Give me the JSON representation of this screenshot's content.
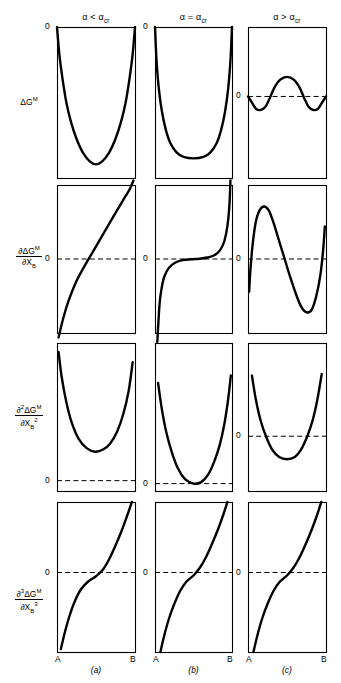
{
  "figure": {
    "background": "#ffffff",
    "ink": "#000000"
  },
  "columns": [
    {
      "id": "a",
      "header": "α < α",
      "header_sub": "cr",
      "letter": "(a)",
      "x": 57,
      "width": 78
    },
    {
      "id": "b",
      "header": "α = α",
      "header_sub": "cr",
      "letter": "(b)",
      "x": 155,
      "width": 77
    },
    {
      "id": "c",
      "header": "α > α",
      "header_sub": "cr",
      "letter": "(c)",
      "x": 248,
      "width": 78
    }
  ],
  "rows": [
    {
      "id": "g",
      "numerator": "∂",
      "label_plain": "ΔG",
      "label_sup": "M",
      "kind": "plain",
      "y": 27,
      "height": 151
    },
    {
      "id": "d1",
      "num_pre": "∂",
      "num_mid": "ΔG",
      "num_sup": "M",
      "den_pre": "∂",
      "den_var": "X",
      "den_sub": "B",
      "den_sup": "",
      "kind": "fraction",
      "y": 185,
      "height": 148
    },
    {
      "id": "d2",
      "num_pre": "∂",
      "num_order": "2",
      "num_mid": "ΔG",
      "num_sup": "M",
      "den_pre": "∂",
      "den_var": "X",
      "den_sub": "B",
      "den_sup": "2",
      "kind": "fraction",
      "y": 343,
      "height": 148
    },
    {
      "id": "d3",
      "num_pre": "∂",
      "num_order": "3",
      "num_mid": "ΔG",
      "num_sup": "M",
      "den_pre": "∂",
      "den_var": "X",
      "den_sub": "B",
      "den_sup": "3",
      "kind": "fraction",
      "y": 502,
      "height": 150
    }
  ],
  "axis": {
    "left_endpoint": "A",
    "right_endpoint": "B",
    "zero_label": "0"
  },
  "chart_data": {
    "type": "line",
    "xlabel": "X_B (from A to B)",
    "ylabel_rows": [
      "ΔG^M",
      "∂ΔG^M/∂X_B",
      "∂²ΔG^M/∂X_B²",
      "∂³ΔG^M/∂X_B³"
    ],
    "column_conditions": [
      "α < α_cr",
      "α = α_cr",
      "α > α_cr"
    ],
    "grid": false,
    "legend": "none",
    "xlim": [
      0,
      1
    ],
    "panels": [
      {
        "row": "g",
        "col": "a",
        "zero_label_pos": "top-left-outside",
        "zero_y_frac": 0.0,
        "dashed_zero": false,
        "description": "Deep symmetric U; starts and ends at 0 on the top edge, minimum near mid-bottom.",
        "points": [
          [
            0.0,
            0.0
          ],
          [
            0.03,
            0.18
          ],
          [
            0.07,
            0.34
          ],
          [
            0.12,
            0.5
          ],
          [
            0.18,
            0.63
          ],
          [
            0.25,
            0.74
          ],
          [
            0.33,
            0.83
          ],
          [
            0.42,
            0.89
          ],
          [
            0.5,
            0.91
          ],
          [
            0.58,
            0.89
          ],
          [
            0.67,
            0.83
          ],
          [
            0.75,
            0.74
          ],
          [
            0.82,
            0.63
          ],
          [
            0.88,
            0.5
          ],
          [
            0.93,
            0.34
          ],
          [
            0.97,
            0.18
          ],
          [
            1.0,
            0.0
          ]
        ]
      },
      {
        "row": "g",
        "col": "b",
        "zero_label_pos": "top-left-outside",
        "zero_y_frac": 0.0,
        "dashed_zero": false,
        "description": "Broad flat-bottomed U; zero at both ends, wide flat minimum.",
        "points": [
          [
            0.0,
            0.0
          ],
          [
            0.02,
            0.22
          ],
          [
            0.05,
            0.41
          ],
          [
            0.09,
            0.56
          ],
          [
            0.14,
            0.68
          ],
          [
            0.2,
            0.77
          ],
          [
            0.28,
            0.83
          ],
          [
            0.37,
            0.86
          ],
          [
            0.5,
            0.87
          ],
          [
            0.63,
            0.86
          ],
          [
            0.72,
            0.83
          ],
          [
            0.8,
            0.77
          ],
          [
            0.86,
            0.68
          ],
          [
            0.91,
            0.56
          ],
          [
            0.95,
            0.41
          ],
          [
            0.98,
            0.22
          ],
          [
            1.0,
            0.0
          ]
        ]
      },
      {
        "row": "g",
        "col": "c",
        "zero_label_pos": "left-outside",
        "zero_y_frac": 0.46,
        "dashed_zero": true,
        "description": "W-shape: two shallow minima below zero separated by a central hump rising above zero.",
        "points": [
          [
            0.0,
            0.46
          ],
          [
            0.05,
            0.5
          ],
          [
            0.1,
            0.54
          ],
          [
            0.16,
            0.55
          ],
          [
            0.22,
            0.53
          ],
          [
            0.28,
            0.47
          ],
          [
            0.34,
            0.4
          ],
          [
            0.41,
            0.35
          ],
          [
            0.5,
            0.33
          ],
          [
            0.59,
            0.35
          ],
          [
            0.66,
            0.4
          ],
          [
            0.72,
            0.47
          ],
          [
            0.78,
            0.53
          ],
          [
            0.84,
            0.55
          ],
          [
            0.9,
            0.54
          ],
          [
            0.95,
            0.5
          ],
          [
            1.0,
            0.46
          ]
        ]
      },
      {
        "row": "d1",
        "col": "a",
        "zero_label_pos": "left-outside",
        "zero_y_frac": 0.5,
        "dashed_zero": true,
        "description": "Monotonic increasing curve, crosses zero slightly right of centre, steep at both ends.",
        "points": [
          [
            0.02,
            1.03
          ],
          [
            0.08,
            0.9
          ],
          [
            0.15,
            0.78
          ],
          [
            0.24,
            0.66
          ],
          [
            0.34,
            0.56
          ],
          [
            0.45,
            0.46
          ],
          [
            0.56,
            0.36
          ],
          [
            0.66,
            0.27
          ],
          [
            0.76,
            0.18
          ],
          [
            0.85,
            0.1
          ],
          [
            0.93,
            0.03
          ],
          [
            0.98,
            -0.03
          ]
        ]
      },
      {
        "row": "d1",
        "col": "b",
        "zero_label_pos": "left-outside",
        "zero_y_frac": 0.5,
        "dashed_zero": true,
        "description": "Monotonic increasing with a flat horizontal inflection plateau exactly on the zero line at mid-composition; asymptotically steep at both ends.",
        "points": [
          [
            0.03,
            1.06
          ],
          [
            0.045,
            0.92
          ],
          [
            0.06,
            0.8
          ],
          [
            0.085,
            0.7
          ],
          [
            0.12,
            0.62
          ],
          [
            0.18,
            0.56
          ],
          [
            0.26,
            0.525
          ],
          [
            0.36,
            0.508
          ],
          [
            0.47,
            0.502
          ],
          [
            0.58,
            0.498
          ],
          [
            0.68,
            0.49
          ],
          [
            0.77,
            0.475
          ],
          [
            0.845,
            0.44
          ],
          [
            0.9,
            0.38
          ],
          [
            0.94,
            0.28
          ],
          [
            0.965,
            0.15
          ],
          [
            0.98,
            -0.03
          ]
        ]
      },
      {
        "row": "d1",
        "col": "c",
        "zero_label_pos": "left-outside",
        "zero_y_frac": 0.5,
        "dashed_zero": true,
        "description": "Non-monotonic S: rises steeply from below zero to a local maximum, falls through zero to a local minimum, then rises steeply again at the right edge.",
        "points": [
          [
            0.015,
            0.72
          ],
          [
            0.03,
            0.58
          ],
          [
            0.06,
            0.4
          ],
          [
            0.1,
            0.25
          ],
          [
            0.15,
            0.17
          ],
          [
            0.21,
            0.145
          ],
          [
            0.27,
            0.175
          ],
          [
            0.33,
            0.26
          ],
          [
            0.4,
            0.38
          ],
          [
            0.47,
            0.5
          ],
          [
            0.54,
            0.62
          ],
          [
            0.61,
            0.73
          ],
          [
            0.68,
            0.82
          ],
          [
            0.75,
            0.86
          ],
          [
            0.82,
            0.84
          ],
          [
            0.88,
            0.74
          ],
          [
            0.93,
            0.6
          ],
          [
            0.965,
            0.43
          ],
          [
            0.985,
            0.28
          ]
        ]
      },
      {
        "row": "d2",
        "col": "a",
        "zero_label_pos": "left-outside",
        "zero_y_frac": 0.93,
        "dashed_zero": true,
        "description": "U-shaped curve lying entirely above the zero line; minimum well above zero.",
        "points": [
          [
            0.02,
            0.06
          ],
          [
            0.06,
            0.23
          ],
          [
            0.12,
            0.4
          ],
          [
            0.19,
            0.54
          ],
          [
            0.28,
            0.65
          ],
          [
            0.38,
            0.71
          ],
          [
            0.49,
            0.735
          ],
          [
            0.59,
            0.72
          ],
          [
            0.68,
            0.68
          ],
          [
            0.77,
            0.6
          ],
          [
            0.85,
            0.48
          ],
          [
            0.92,
            0.32
          ],
          [
            0.97,
            0.13
          ]
        ]
      },
      {
        "row": "d2",
        "col": "b",
        "zero_label_pos": "left-outside",
        "zero_y_frac": 0.95,
        "dashed_zero": true,
        "description": "U-shaped curve whose minimum is exactly tangent to the zero line at mid-composition.",
        "points": [
          [
            0.04,
            0.27
          ],
          [
            0.09,
            0.45
          ],
          [
            0.15,
            0.61
          ],
          [
            0.22,
            0.74
          ],
          [
            0.3,
            0.85
          ],
          [
            0.39,
            0.92
          ],
          [
            0.5,
            0.95
          ],
          [
            0.6,
            0.94
          ],
          [
            0.69,
            0.89
          ],
          [
            0.77,
            0.8
          ],
          [
            0.84,
            0.69
          ],
          [
            0.9,
            0.55
          ],
          [
            0.95,
            0.38
          ],
          [
            0.985,
            0.22
          ]
        ]
      },
      {
        "row": "d2",
        "col": "c",
        "zero_label_pos": "left-outside",
        "zero_y_frac": 0.63,
        "dashed_zero": true,
        "description": "U-shaped curve that dips below the zero line between two roots (spinodal points); ends above zero.",
        "points": [
          [
            0.05,
            0.22
          ],
          [
            0.1,
            0.38
          ],
          [
            0.16,
            0.52
          ],
          [
            0.23,
            0.63
          ],
          [
            0.31,
            0.72
          ],
          [
            0.4,
            0.77
          ],
          [
            0.5,
            0.785
          ],
          [
            0.6,
            0.77
          ],
          [
            0.68,
            0.72
          ],
          [
            0.76,
            0.63
          ],
          [
            0.83,
            0.52
          ],
          [
            0.89,
            0.38
          ],
          [
            0.945,
            0.21
          ]
        ]
      },
      {
        "row": "d3",
        "col": "a",
        "zero_label_pos": "left-outside",
        "zero_y_frac": 0.47,
        "dashed_zero": true,
        "description": "Monotonic rising S-curve crossing zero just right of centre.",
        "points": [
          [
            0.05,
            0.98
          ],
          [
            0.1,
            0.87
          ],
          [
            0.16,
            0.76
          ],
          [
            0.23,
            0.66
          ],
          [
            0.31,
            0.58
          ],
          [
            0.4,
            0.53
          ],
          [
            0.5,
            0.495
          ],
          [
            0.59,
            0.45
          ],
          [
            0.67,
            0.38
          ],
          [
            0.75,
            0.29
          ],
          [
            0.83,
            0.19
          ],
          [
            0.9,
            0.09
          ],
          [
            0.96,
            0.0
          ]
        ]
      },
      {
        "row": "d3",
        "col": "b",
        "zero_label_pos": "left-outside",
        "zero_y_frac": 0.47,
        "dashed_zero": true,
        "description": "Monotonic rising S-curve crossing zero near mid-composition.",
        "points": [
          [
            0.07,
            1.0
          ],
          [
            0.12,
            0.89
          ],
          [
            0.18,
            0.78
          ],
          [
            0.25,
            0.68
          ],
          [
            0.33,
            0.59
          ],
          [
            0.41,
            0.53
          ],
          [
            0.5,
            0.49
          ],
          [
            0.58,
            0.44
          ],
          [
            0.66,
            0.37
          ],
          [
            0.74,
            0.28
          ],
          [
            0.82,
            0.18
          ],
          [
            0.89,
            0.08
          ],
          [
            0.94,
            0.0
          ]
        ]
      },
      {
        "row": "d3",
        "col": "c",
        "zero_label_pos": "left-outside",
        "zero_y_frac": 0.47,
        "dashed_zero": true,
        "description": "Monotonic rising S-curve crossing zero near mid-composition.",
        "points": [
          [
            0.07,
            1.0
          ],
          [
            0.12,
            0.89
          ],
          [
            0.18,
            0.78
          ],
          [
            0.25,
            0.68
          ],
          [
            0.33,
            0.59
          ],
          [
            0.41,
            0.53
          ],
          [
            0.5,
            0.49
          ],
          [
            0.58,
            0.44
          ],
          [
            0.66,
            0.37
          ],
          [
            0.74,
            0.28
          ],
          [
            0.82,
            0.18
          ],
          [
            0.89,
            0.08
          ],
          [
            0.94,
            0.0
          ]
        ]
      }
    ]
  }
}
